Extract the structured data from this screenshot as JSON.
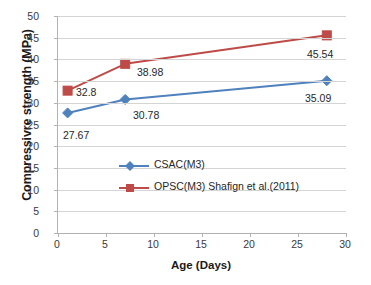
{
  "chart_data": {
    "type": "line",
    "title": "",
    "xlabel": "Age (Days)",
    "ylabel": "Compressivre strength (MPa)",
    "xlim": [
      0,
      30
    ],
    "ylim": [
      0,
      50
    ],
    "x_ticks": [
      0,
      5,
      10,
      15,
      20,
      25,
      30
    ],
    "y_ticks": [
      0,
      5,
      10,
      15,
      20,
      25,
      30,
      35,
      40,
      45,
      50
    ],
    "grid": "horizontal",
    "legend_position": "inside-lower-right",
    "x": [
      1,
      7,
      28
    ],
    "series": [
      {
        "name": "CSAC(M3)",
        "values": [
          27.67,
          30.78,
          35.09
        ],
        "color": "#4F81BD",
        "marker": "diamond",
        "labels": [
          "27.67",
          "30.78",
          "35.09"
        ]
      },
      {
        "name": "OPSC(M3) Shafign et al.(2011)",
        "values": [
          32.8,
          38.98,
          45.54
        ],
        "color": "#BE4B48",
        "marker": "square",
        "labels": [
          "32.8",
          "38.98",
          "45.54"
        ]
      }
    ],
    "colors": {
      "series_1": "#4F81BD",
      "series_2": "#BE4B48",
      "gridline": "#D4D4D4",
      "axis": "#B3B3B3",
      "text": "#262626",
      "background": "#FFFFFF"
    }
  },
  "axes": {
    "y_tick_labels": [
      "0",
      "5",
      "10",
      "15",
      "20",
      "25",
      "30",
      "35",
      "40",
      "45",
      "50"
    ],
    "x_tick_labels": [
      "0",
      "5",
      "10",
      "15",
      "20",
      "25",
      "30"
    ],
    "y_title": "Compressivre strength (MPa)",
    "x_title": "Age (Days)"
  },
  "legend": {
    "entries": [
      {
        "label": "CSAC(M3)"
      },
      {
        "label": "OPSC(M3) Shafign et al.(2011)"
      }
    ]
  },
  "data_labels": {
    "s1_p1": "27.67",
    "s1_p2": "30.78",
    "s1_p3": "35.09",
    "s2_p1": "32.8",
    "s2_p2": "38.98",
    "s2_p3": "45.54"
  }
}
